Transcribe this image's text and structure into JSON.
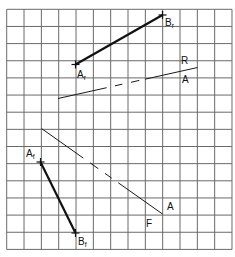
{
  "grid": {
    "left": 6.7,
    "top": 9.3,
    "cols": 13,
    "rows": 14,
    "cell_w": 17.33,
    "cell_h": 17.15,
    "line_color": "#6a6a6a"
  },
  "lines": {
    "ArBr": {
      "label_start": "A",
      "label_start_sub": "r",
      "label_end": "B",
      "label_end_sub": "r",
      "start": [
        75.5,
        64.5
      ],
      "end": [
        162.5,
        15.0
      ],
      "style": "thick"
    },
    "AfBf": {
      "label_start": "A",
      "label_start_sub": "f",
      "label_end": "B",
      "label_end_sub": "f",
      "start": [
        40.5,
        162.0
      ],
      "end": [
        75.5,
        233.0
      ],
      "style": "thick"
    },
    "RA": {
      "label_top": "R",
      "label_bottom": "A",
      "start": [
        58.0,
        98.5
      ],
      "end": [
        197.5,
        67.5
      ],
      "dashed_between": [
        [
          106.7,
          122.3
        ],
        [
          131.0,
          139.3
        ]
      ],
      "solid_end_x": 106.7,
      "solid_resume_x": 145.0,
      "style": "thin"
    },
    "FA": {
      "label_top": "A",
      "label_bottom": "F",
      "start": [
        41.5,
        128.5
      ],
      "end": [
        162.5,
        214.0
      ],
      "dashes": [
        [
          90.0,
          98.3
        ],
        [
          105.0,
          111.7
        ]
      ],
      "solid_end_x": 83.3,
      "solid_resume_x": 118.3,
      "style": "thin"
    }
  }
}
